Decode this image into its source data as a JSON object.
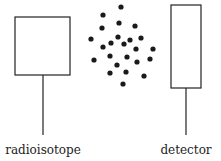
{
  "diagram": {
    "title": "",
    "colors": {
      "stroke": "#222222",
      "dot": "#1a1a1a",
      "background": "#ffffff"
    },
    "source": {
      "label": "radioisotope",
      "box": {
        "x": 15,
        "y": 17,
        "w": 55,
        "h": 58
      },
      "stem": {
        "x": 43,
        "y1": 75,
        "y2": 135
      },
      "label_pos": {
        "x": 43,
        "y": 143
      }
    },
    "detector": {
      "label": "detector",
      "box": {
        "x": 171,
        "y": 5,
        "w": 30,
        "h": 83
      },
      "stem": {
        "x": 186,
        "y1": 88,
        "y2": 135
      },
      "label_pos": {
        "x": 186,
        "y": 143
      }
    },
    "particles": [
      [
        121,
        7
      ],
      [
        103,
        15
      ],
      [
        119,
        23
      ],
      [
        102,
        28
      ],
      [
        135,
        26
      ],
      [
        91,
        39
      ],
      [
        118,
        37
      ],
      [
        111,
        43
      ],
      [
        124,
        44
      ],
      [
        130,
        40
      ],
      [
        141,
        38
      ],
      [
        103,
        47
      ],
      [
        136,
        49
      ],
      [
        153,
        49
      ],
      [
        94,
        60
      ],
      [
        110,
        56
      ],
      [
        127,
        57
      ],
      [
        150,
        59
      ],
      [
        117,
        65
      ],
      [
        137,
        62
      ],
      [
        110,
        73
      ],
      [
        126,
        72
      ],
      [
        144,
        76
      ],
      [
        123,
        84
      ]
    ],
    "particle_radius": 2.6
  }
}
